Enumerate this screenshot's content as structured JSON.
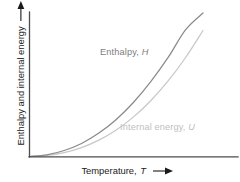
{
  "figure": {
    "background_color": "#ffffff",
    "axis_color": "#4d4d4d"
  },
  "axes": {
    "x_title_text": "Temperature,",
    "x_title_symbol": "T",
    "x_arrow_icon": "right-arrow-icon",
    "y_title_text": "Enthalpy and internal energy",
    "y_arrow_icon": "up-arrow-icon"
  },
  "series_labels": {
    "enthalpy": {
      "text": "Enthalpy,",
      "symbol": "H",
      "color": "#7d7d7d"
    },
    "internal_energy": {
      "text": "Internal energy,",
      "symbol": "U",
      "color": "#c0c0c0"
    }
  },
  "chart_data": {
    "type": "line",
    "title": "",
    "subtitle": "",
    "xlabel": "Temperature, T",
    "ylabel": "Enthalpy and internal energy",
    "grid": false,
    "legend": "inline-annotations",
    "axis_ticks": "none",
    "xlim": [
      0,
      1
    ],
    "ylim": [
      0,
      1
    ],
    "x": [
      0,
      0.1,
      0.2,
      0.3,
      0.4,
      0.5,
      0.6,
      0.7,
      0.8,
      0.9,
      1.0
    ],
    "series": [
      {
        "name": "Enthalpy, H",
        "symbol": "H",
        "color": "#8a8a8a",
        "values": [
          0,
          0.012,
          0.042,
          0.091,
          0.163,
          0.258,
          0.378,
          0.523,
          0.692,
          0.884,
          1.0
        ]
      },
      {
        "name": "Internal energy, U",
        "symbol": "U",
        "color": "#c8c8c8",
        "values": [
          0,
          0.007,
          0.027,
          0.062,
          0.114,
          0.185,
          0.276,
          0.39,
          0.528,
          0.69,
          0.878
        ]
      }
    ],
    "annotations": [
      {
        "text": "Enthalpy, H",
        "x": 0.34,
        "y": 0.72
      },
      {
        "text": "Internal energy, U",
        "x": 0.44,
        "y": 0.2
      }
    ]
  }
}
